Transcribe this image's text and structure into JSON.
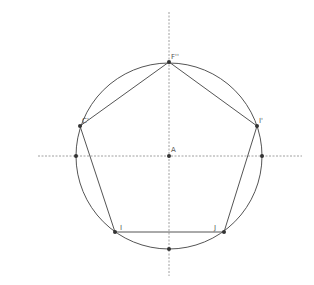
{
  "diagram": {
    "type": "geometric-construction",
    "center": {
      "label": "A",
      "x": 169,
      "y": 156
    },
    "circle": {
      "radius": 93,
      "stroke": "#555555"
    },
    "axes": {
      "horizontal": {
        "x1": 38,
        "x2": 302,
        "y": 156
      },
      "vertical": {
        "x": 169,
        "y1": 12,
        "y2": 276
      },
      "stroke": "#888888"
    },
    "vertices": [
      {
        "label": "F''",
        "x": 169,
        "y": 62
      },
      {
        "label": "I'",
        "x": 257,
        "y": 126
      },
      {
        "label": "J",
        "x": 224,
        "y": 232
      },
      {
        "label": "I",
        "x": 115,
        "y": 232
      },
      {
        "label": "C'",
        "x": 80,
        "y": 126
      }
    ],
    "extra_points": [
      {
        "name": "left-axis-intersection",
        "x": 76,
        "y": 156
      },
      {
        "name": "right-axis-intersection",
        "x": 262,
        "y": 156
      },
      {
        "name": "bottom-axis-intersection",
        "x": 169,
        "y": 249
      }
    ],
    "labels": {
      "center": "A",
      "top": "F''",
      "right": "I'",
      "bottom_right": "J",
      "bottom_left": "I",
      "left": "C'"
    },
    "colors": {
      "line": "#555555",
      "axis": "#888888",
      "point": "#333333",
      "background": "#ffffff"
    }
  }
}
